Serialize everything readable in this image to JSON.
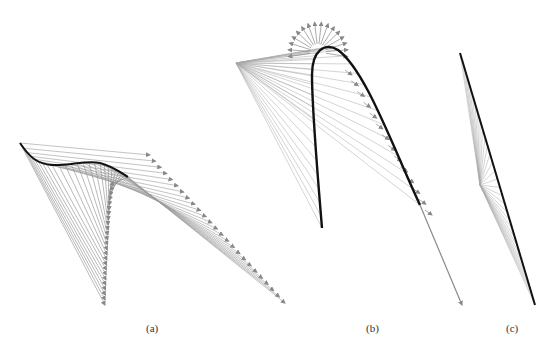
{
  "figure": {
    "panels": [
      {
        "id": "a",
        "label": "(a)",
        "label_pos": [
          152,
          330
        ]
      },
      {
        "id": "b",
        "label": "(b)",
        "label_pos": [
          372,
          330
        ]
      },
      {
        "id": "c",
        "label": "(c)",
        "label_pos": [
          512,
          330
        ]
      }
    ],
    "colors": {
      "curve": "#111111",
      "vector": "#8a8a8a",
      "fan_line": "#a8a8a8",
      "background": "#ffffff"
    }
  }
}
